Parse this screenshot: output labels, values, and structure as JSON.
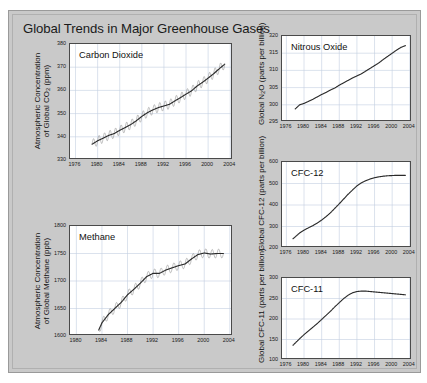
{
  "figure": {
    "title": "Global Trends in Major Greenhouse Gases",
    "background_color": "#c9c9c9",
    "line_color": "#2b2b2b",
    "grid_color": "#c3cfe0"
  },
  "chart_data": [
    {
      "type": "line",
      "id": "carbon-dioxide",
      "title": "Carbon Dioxide",
      "ylabel_line1": "Atmospheric Concentration",
      "ylabel_line2": "of Global CO₂ (ppm)",
      "xlabel": "",
      "xlim": [
        1975,
        2004.5
      ],
      "ylim": [
        330,
        380
      ],
      "yticks": [
        330,
        340,
        350,
        360,
        370,
        380
      ],
      "xticks": [
        1976,
        1980,
        1984,
        1988,
        1992,
        1996,
        2000,
        2004
      ],
      "grid": true,
      "legend": "none",
      "units": "ppm",
      "series": [
        {
          "name": "Global CO2 trend (smoothed)",
          "x": [
            1979.0,
            1980.0,
            1981.0,
            1982.0,
            1983.0,
            1984.0,
            1985.0,
            1986.0,
            1987.0,
            1988.0,
            1989.0,
            1990.0,
            1991.0,
            1992.0,
            1993.0,
            1994.0,
            1995.0,
            1996.0,
            1997.0,
            1998.0,
            1999.0,
            2000.0,
            2001.0,
            2002.0,
            2003.0
          ],
          "values": [
            336.8,
            338.3,
            339.4,
            340.6,
            341.4,
            342.8,
            344.0,
            345.3,
            346.9,
            348.8,
            350.4,
            351.6,
            352.6,
            353.3,
            354.0,
            355.5,
            356.9,
            358.4,
            359.8,
            361.9,
            363.5,
            365.3,
            367.2,
            369.3,
            371.3
          ]
        }
      ]
    },
    {
      "type": "line",
      "id": "methane",
      "title": "Methane",
      "ylabel_line1": "Atmospheric Concentration",
      "ylabel_line2": "of Global Methane (ppb)",
      "xlabel": "",
      "xlim": [
        1979,
        2004.5
      ],
      "ylim": [
        1600,
        1800
      ],
      "yticks": [
        1600,
        1650,
        1700,
        1750,
        1800
      ],
      "xticks": [
        1980,
        1984,
        1988,
        1992,
        1996,
        2000,
        2004
      ],
      "grid": true,
      "legend": "none",
      "units": "ppb",
      "series": [
        {
          "name": "Global methane trend (smoothed)",
          "x": [
            1983.5,
            1984.0,
            1985.0,
            1986.0,
            1987.0,
            1988.0,
            1989.0,
            1990.0,
            1991.0,
            1992.0,
            1993.0,
            1994.0,
            1995.0,
            1996.0,
            1997.0,
            1998.0,
            1999.0,
            2000.0,
            2001.0,
            2002.0,
            2003.0
          ],
          "values": [
            1611,
            1624,
            1639,
            1650,
            1661,
            1675,
            1685,
            1696,
            1708,
            1714,
            1714,
            1720,
            1724,
            1728,
            1731,
            1740,
            1748,
            1751,
            1749,
            1750,
            1750
          ]
        }
      ]
    },
    {
      "type": "line",
      "id": "nitrous-oxide",
      "title": "Nitrous Oxide",
      "ylabel_line1": "Global N₂O (parts per billion)",
      "xlabel": "",
      "xlim": [
        1975,
        2004.5
      ],
      "ylim": [
        295,
        320
      ],
      "yticks": [
        295,
        300,
        305,
        310,
        315,
        320
      ],
      "xticks": [
        1976,
        1980,
        1984,
        1988,
        1992,
        1996,
        2000,
        2004
      ],
      "grid": true,
      "legend": "none",
      "units": "parts per billion",
      "series": [
        {
          "name": "Global N2O",
          "x": [
            1978.0,
            1979.0,
            1980.0,
            1981.0,
            1982.0,
            1983.0,
            1984.0,
            1985.0,
            1986.0,
            1987.0,
            1988.0,
            1989.0,
            1990.0,
            1991.0,
            1992.0,
            1993.0,
            1994.0,
            1995.0,
            1996.0,
            1997.0,
            1998.0,
            1999.0,
            2000.0,
            2001.0,
            2002.0,
            2003.0
          ],
          "values": [
            298.8,
            300.0,
            300.4,
            301.0,
            301.6,
            302.3,
            303.0,
            303.6,
            304.3,
            304.9,
            305.7,
            306.4,
            307.1,
            307.8,
            308.4,
            309.0,
            309.8,
            310.6,
            311.4,
            312.2,
            313.2,
            314.1,
            315.0,
            315.9,
            316.7,
            317.2
          ]
        }
      ]
    },
    {
      "type": "line",
      "id": "cfc-12",
      "title": "CFC-12",
      "ylabel_line1": "Global CFC-12 (parts per billion)",
      "xlabel": "",
      "xlim": [
        1975,
        2004.5
      ],
      "ylim": [
        200,
        600
      ],
      "yticks": [
        200,
        300,
        400,
        500,
        600
      ],
      "xticks": [
        1976,
        1980,
        1984,
        1988,
        1992,
        1996,
        2000,
        2004
      ],
      "grid": true,
      "legend": "none",
      "units": "parts per billion",
      "series": [
        {
          "name": "Global CFC-12",
          "x": [
            1977.5,
            1979.0,
            1980.0,
            1981.0,
            1982.0,
            1983.0,
            1984.0,
            1985.0,
            1986.0,
            1987.0,
            1988.0,
            1989.0,
            1990.0,
            1991.0,
            1992.0,
            1993.0,
            1994.0,
            1995.0,
            1996.0,
            1997.0,
            1998.0,
            1999.0,
            2000.0,
            2001.0,
            2002.0,
            2003.0
          ],
          "values": [
            243,
            270,
            283,
            294,
            304,
            316,
            330,
            346,
            364,
            385,
            406,
            428,
            450,
            470,
            489,
            503,
            513,
            521,
            527,
            531,
            534,
            536,
            537,
            538,
            538,
            538
          ]
        }
      ]
    },
    {
      "type": "line",
      "id": "cfc-11",
      "title": "CFC-11",
      "ylabel_line1": "Global CFC-11 (parts per billion)",
      "xlabel": "",
      "xlim": [
        1975,
        2004.5
      ],
      "ylim": [
        100,
        300
      ],
      "yticks": [
        100,
        150,
        200,
        250,
        300
      ],
      "xticks": [
        1976,
        1980,
        1984,
        1988,
        1992,
        1996,
        2000,
        2004
      ],
      "grid": true,
      "legend": "none",
      "units": "parts per billion",
      "series": [
        {
          "name": "Global CFC-11",
          "x": [
            1977.5,
            1979.0,
            1980.0,
            1981.0,
            1982.0,
            1983.0,
            1984.0,
            1985.0,
            1986.0,
            1987.0,
            1988.0,
            1989.0,
            1990.0,
            1991.0,
            1992.0,
            1993.0,
            1994.0,
            1995.0,
            1996.0,
            1997.0,
            1998.0,
            1999.0,
            2000.0,
            2001.0,
            2002.0,
            2003.0
          ],
          "values": [
            136,
            152,
            162,
            171,
            180,
            189,
            199,
            209,
            219,
            230,
            240,
            250,
            258,
            264,
            267,
            268,
            268,
            267,
            266,
            265,
            264,
            263,
            262,
            261,
            260,
            259
          ]
        }
      ]
    }
  ]
}
